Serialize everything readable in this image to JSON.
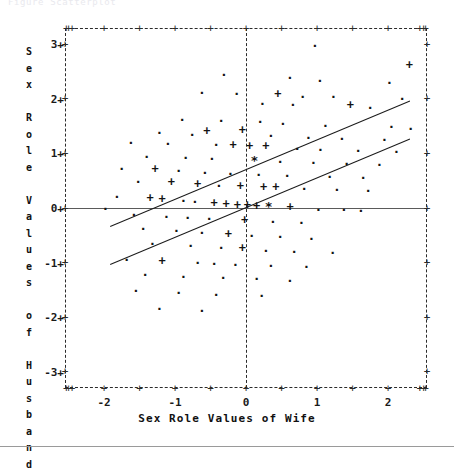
{
  "caption": {
    "text": "Figure  Scatterplot"
  },
  "axes": {
    "y_title": "Sex Role Values of Husband",
    "x_title": "Sex Role Values of Wife",
    "y_ticks": [
      "3",
      "2",
      "1",
      "0",
      "-1",
      "-2",
      "-3"
    ],
    "x_ticks": [
      "-2",
      "-1",
      "0",
      "1",
      "2"
    ],
    "tick_glyph": "+",
    "y_range": [
      -3.3,
      3.3
    ],
    "x_range": [
      -2.55,
      2.55
    ]
  },
  "style": {
    "frame_color": "#2b2b2b",
    "line_color": "#1b1b1b",
    "text_color": "#111111",
    "zero_line_color": "#5a5a5a"
  },
  "chart_data": {
    "type": "scatter",
    "title": "",
    "xlabel": "Sex Role Values of Wife",
    "ylabel": "Sex Role Values of Husband",
    "xlim": [
      -2.55,
      2.55
    ],
    "ylim": [
      -3.3,
      3.3
    ],
    "grid": false,
    "legend": null,
    "marker_legend": {
      ".": "1 observation",
      "+": "2 observations",
      "*": "3 or more observations"
    },
    "series": [
      {
        "name": "observations",
        "marker_field": "m",
        "points": [
          {
            "x": 0.97,
            "y": 2.98,
            "m": "."
          },
          {
            "x": 2.3,
            "y": 2.62,
            "m": "+"
          },
          {
            "x": -0.31,
            "y": 2.45,
            "m": "."
          },
          {
            "x": 0.62,
            "y": 2.4,
            "m": "."
          },
          {
            "x": 1.04,
            "y": 2.34,
            "m": "."
          },
          {
            "x": 2.02,
            "y": 2.3,
            "m": "."
          },
          {
            "x": -0.62,
            "y": 2.12,
            "m": "."
          },
          {
            "x": -0.13,
            "y": 2.1,
            "m": "."
          },
          {
            "x": 0.45,
            "y": 2.08,
            "m": "+"
          },
          {
            "x": 0.8,
            "y": 2.05,
            "m": "."
          },
          {
            "x": 1.23,
            "y": 2.04,
            "m": "."
          },
          {
            "x": 2.2,
            "y": 2.0,
            "m": "."
          },
          {
            "x": 0.23,
            "y": 1.92,
            "m": "."
          },
          {
            "x": 0.66,
            "y": 1.9,
            "m": "."
          },
          {
            "x": 1.47,
            "y": 1.88,
            "m": "+"
          },
          {
            "x": 1.75,
            "y": 1.84,
            "m": "."
          },
          {
            "x": -0.9,
            "y": 1.62,
            "m": "."
          },
          {
            "x": -0.35,
            "y": 1.6,
            "m": "."
          },
          {
            "x": 0.2,
            "y": 1.58,
            "m": "."
          },
          {
            "x": 0.52,
            "y": 1.55,
            "m": "."
          },
          {
            "x": 1.12,
            "y": 1.52,
            "m": "."
          },
          {
            "x": 2.05,
            "y": 1.5,
            "m": "."
          },
          {
            "x": 2.32,
            "y": 1.46,
            "m": "."
          },
          {
            "x": -0.05,
            "y": 1.42,
            "m": "+"
          },
          {
            "x": -0.55,
            "y": 1.4,
            "m": "+"
          },
          {
            "x": -1.22,
            "y": 1.38,
            "m": "."
          },
          {
            "x": -0.76,
            "y": 1.35,
            "m": "."
          },
          {
            "x": 0.35,
            "y": 1.33,
            "m": "."
          },
          {
            "x": 0.88,
            "y": 1.3,
            "m": "."
          },
          {
            "x": 1.35,
            "y": 1.28,
            "m": "."
          },
          {
            "x": 1.95,
            "y": 1.26,
            "m": "."
          },
          {
            "x": -1.62,
            "y": 1.2,
            "m": "."
          },
          {
            "x": -1.1,
            "y": 1.18,
            "m": "."
          },
          {
            "x": -0.42,
            "y": 1.16,
            "m": "."
          },
          {
            "x": -0.18,
            "y": 1.14,
            "m": "+"
          },
          {
            "x": 0.05,
            "y": 1.13,
            "m": "+"
          },
          {
            "x": 0.28,
            "y": 1.12,
            "m": "+"
          },
          {
            "x": 0.72,
            "y": 1.1,
            "m": "."
          },
          {
            "x": 1.05,
            "y": 1.08,
            "m": "."
          },
          {
            "x": 1.58,
            "y": 1.06,
            "m": "."
          },
          {
            "x": 2.12,
            "y": 1.04,
            "m": "."
          },
          {
            "x": -1.4,
            "y": 0.95,
            "m": "."
          },
          {
            "x": -0.85,
            "y": 0.92,
            "m": "."
          },
          {
            "x": -0.48,
            "y": 0.9,
            "m": "."
          },
          {
            "x": 0.12,
            "y": 0.88,
            "m": "*"
          },
          {
            "x": 0.48,
            "y": 0.86,
            "m": "."
          },
          {
            "x": 0.95,
            "y": 0.84,
            "m": "."
          },
          {
            "x": 1.42,
            "y": 0.82,
            "m": "."
          },
          {
            "x": 1.88,
            "y": 0.8,
            "m": "."
          },
          {
            "x": -1.75,
            "y": 0.72,
            "m": "."
          },
          {
            "x": -1.28,
            "y": 0.7,
            "m": "+"
          },
          {
            "x": -0.95,
            "y": 0.68,
            "m": "."
          },
          {
            "x": -0.58,
            "y": 0.66,
            "m": "."
          },
          {
            "x": -0.22,
            "y": 0.64,
            "m": "."
          },
          {
            "x": 0.18,
            "y": 0.62,
            "m": "."
          },
          {
            "x": 0.58,
            "y": 0.6,
            "m": "."
          },
          {
            "x": 1.18,
            "y": 0.58,
            "m": "."
          },
          {
            "x": 1.65,
            "y": 0.56,
            "m": "."
          },
          {
            "x": -1.52,
            "y": 0.48,
            "m": "."
          },
          {
            "x": -1.05,
            "y": 0.46,
            "m": "+"
          },
          {
            "x": -0.68,
            "y": 0.44,
            "m": "+"
          },
          {
            "x": -0.38,
            "y": 0.42,
            "m": "."
          },
          {
            "x": -0.08,
            "y": 0.4,
            "m": "+"
          },
          {
            "x": 0.25,
            "y": 0.38,
            "m": "+"
          },
          {
            "x": 0.42,
            "y": 0.37,
            "m": "+"
          },
          {
            "x": 0.82,
            "y": 0.36,
            "m": "."
          },
          {
            "x": 1.28,
            "y": 0.34,
            "m": "."
          },
          {
            "x": 1.72,
            "y": 0.32,
            "m": "."
          },
          {
            "x": -1.82,
            "y": 0.22,
            "m": "."
          },
          {
            "x": -1.35,
            "y": 0.18,
            "m": "+"
          },
          {
            "x": -1.18,
            "y": 0.16,
            "m": "+"
          },
          {
            "x": -0.88,
            "y": 0.14,
            "m": "."
          },
          {
            "x": -0.72,
            "y": 0.12,
            "m": "."
          },
          {
            "x": -0.45,
            "y": 0.08,
            "m": "+"
          },
          {
            "x": -0.28,
            "y": 0.06,
            "m": "+"
          },
          {
            "x": -0.12,
            "y": 0.05,
            "m": "+"
          },
          {
            "x": 0.02,
            "y": 0.04,
            "m": "+"
          },
          {
            "x": 0.15,
            "y": 0.03,
            "m": "+"
          },
          {
            "x": 0.32,
            "y": 0.02,
            "m": "*"
          },
          {
            "x": 0.62,
            "y": 0.01,
            "m": "+"
          },
          {
            "x": -1.98,
            "y": 0.0,
            "m": "."
          },
          {
            "x": 1.02,
            "y": -0.02,
            "m": "."
          },
          {
            "x": 1.38,
            "y": -0.03,
            "m": "."
          },
          {
            "x": 1.62,
            "y": -0.04,
            "m": "."
          },
          {
            "x": -1.58,
            "y": -0.12,
            "m": "."
          },
          {
            "x": -1.12,
            "y": -0.15,
            "m": "."
          },
          {
            "x": -0.82,
            "y": -0.18,
            "m": "."
          },
          {
            "x": -0.52,
            "y": -0.2,
            "m": "."
          },
          {
            "x": -0.02,
            "y": -0.22,
            "m": "+"
          },
          {
            "x": 0.38,
            "y": -0.24,
            "m": "."
          },
          {
            "x": 0.78,
            "y": -0.26,
            "m": "."
          },
          {
            "x": -1.45,
            "y": -0.38,
            "m": "."
          },
          {
            "x": -0.98,
            "y": -0.42,
            "m": "."
          },
          {
            "x": -0.62,
            "y": -0.45,
            "m": "."
          },
          {
            "x": -0.25,
            "y": -0.48,
            "m": "+"
          },
          {
            "x": 0.08,
            "y": -0.5,
            "m": "."
          },
          {
            "x": 0.48,
            "y": -0.52,
            "m": "."
          },
          {
            "x": 0.92,
            "y": -0.55,
            "m": "."
          },
          {
            "x": -1.32,
            "y": -0.65,
            "m": "."
          },
          {
            "x": -0.78,
            "y": -0.68,
            "m": "."
          },
          {
            "x": -0.35,
            "y": -0.72,
            "m": "."
          },
          {
            "x": -0.05,
            "y": -0.75,
            "m": "+"
          },
          {
            "x": 0.28,
            "y": -0.78,
            "m": "."
          },
          {
            "x": 0.68,
            "y": -0.8,
            "m": "."
          },
          {
            "x": 1.22,
            "y": -0.82,
            "m": "."
          },
          {
            "x": -1.68,
            "y": -0.95,
            "m": "."
          },
          {
            "x": -1.18,
            "y": -0.98,
            "m": "+"
          },
          {
            "x": -0.68,
            "y": -1.0,
            "m": "."
          },
          {
            "x": -0.45,
            "y": -1.02,
            "m": "."
          },
          {
            "x": -0.15,
            "y": -1.04,
            "m": "."
          },
          {
            "x": 0.35,
            "y": -1.06,
            "m": "."
          },
          {
            "x": 0.85,
            "y": -1.08,
            "m": "."
          },
          {
            "x": -1.42,
            "y": -1.22,
            "m": "."
          },
          {
            "x": -0.88,
            "y": -1.25,
            "m": "."
          },
          {
            "x": -0.32,
            "y": -1.28,
            "m": "."
          },
          {
            "x": 0.15,
            "y": -1.3,
            "m": "."
          },
          {
            "x": 0.62,
            "y": -1.32,
            "m": "."
          },
          {
            "x": -1.55,
            "y": -1.52,
            "m": "."
          },
          {
            "x": -0.95,
            "y": -1.55,
            "m": "."
          },
          {
            "x": -0.42,
            "y": -1.58,
            "m": "."
          },
          {
            "x": 0.22,
            "y": -1.6,
            "m": "."
          },
          {
            "x": -1.22,
            "y": -1.85,
            "m": "."
          },
          {
            "x": -0.62,
            "y": -1.88,
            "m": "."
          }
        ]
      }
    ],
    "regression_lines": [
      {
        "name": "upper-line",
        "slope": 0.545,
        "intercept": 0.72,
        "x_start": -1.92,
        "x_end": 2.3,
        "style": "solid"
      },
      {
        "name": "lower-line",
        "slope": 0.545,
        "intercept": 0.02,
        "x_start": -1.92,
        "x_end": 2.3,
        "style": "solid"
      }
    ]
  }
}
